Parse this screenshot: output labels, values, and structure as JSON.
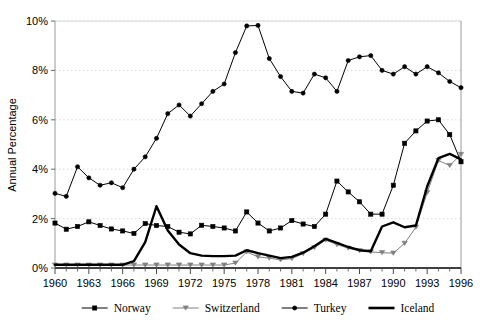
{
  "chart_data": {
    "type": "line",
    "title": "",
    "xlabel": "",
    "ylabel": "Annual Percentage",
    "xlim": [
      1960,
      1996
    ],
    "ylim": [
      0,
      10
    ],
    "grid": true,
    "grid_axis": "y",
    "legend_position": "bottom",
    "y_tick_labels": [
      "0%",
      "2%",
      "4%",
      "6%",
      "8%",
      "10%"
    ],
    "y_tick_values": [
      0,
      2,
      4,
      6,
      8,
      10
    ],
    "x_tick_labels": [
      "1960",
      "1963",
      "1966",
      "1969",
      "1972",
      "1975",
      "1978",
      "1981",
      "1984",
      "1987",
      "1990",
      "1993",
      "1996"
    ],
    "x_tick_values": [
      1960,
      1963,
      1966,
      1969,
      1972,
      1975,
      1978,
      1981,
      1984,
      1987,
      1990,
      1993,
      1996
    ],
    "x": [
      1960,
      1961,
      1962,
      1963,
      1964,
      1965,
      1966,
      1967,
      1968,
      1969,
      1970,
      1971,
      1972,
      1973,
      1974,
      1975,
      1976,
      1977,
      1978,
      1979,
      1980,
      1981,
      1982,
      1983,
      1984,
      1985,
      1986,
      1987,
      1988,
      1989,
      1990,
      1991,
      1992,
      1993,
      1994,
      1995,
      1996
    ],
    "series": [
      {
        "name": "Norway",
        "marker": "square",
        "color": "#000000",
        "marker_color": "#000000",
        "line_width": 1,
        "values": [
          1.82,
          1.57,
          1.68,
          1.87,
          1.72,
          1.58,
          1.5,
          1.4,
          1.8,
          1.72,
          1.68,
          1.45,
          1.38,
          1.73,
          1.68,
          1.62,
          1.5,
          2.27,
          1.82,
          1.5,
          1.62,
          1.92,
          1.78,
          1.68,
          2.18,
          3.52,
          3.08,
          2.68,
          2.18,
          2.18,
          3.35,
          5.05,
          5.55,
          5.95,
          6.0,
          5.4,
          4.3
        ]
      },
      {
        "name": "Switzerland",
        "marker": "triangle-down",
        "color": "#808080",
        "marker_color": "#808080",
        "line_width": 1,
        "values": [
          0.12,
          0.12,
          0.12,
          0.12,
          0.12,
          0.12,
          0.12,
          0.12,
          0.12,
          0.12,
          0.12,
          0.12,
          0.12,
          0.12,
          0.12,
          0.12,
          0.2,
          0.65,
          0.45,
          0.4,
          0.33,
          0.38,
          0.58,
          0.82,
          1.13,
          0.95,
          0.8,
          0.7,
          0.65,
          0.62,
          0.6,
          1.0,
          1.65,
          3.05,
          4.35,
          4.15,
          4.6
        ]
      },
      {
        "name": "Turkey",
        "marker": "circle",
        "color": "#000000",
        "marker_color": "#000000",
        "line_width": 1,
        "values": [
          3.02,
          2.9,
          4.1,
          3.65,
          3.35,
          3.45,
          3.25,
          4.0,
          4.5,
          5.25,
          6.25,
          6.6,
          6.15,
          6.65,
          7.15,
          7.45,
          8.72,
          9.8,
          9.82,
          8.48,
          7.75,
          7.15,
          7.08,
          7.85,
          7.7,
          7.15,
          8.4,
          8.55,
          8.6,
          8.0,
          7.85,
          8.15,
          7.85,
          8.15,
          7.9,
          7.55,
          7.3
        ]
      },
      {
        "name": "Iceland",
        "marker": "none",
        "color": "#000000",
        "marker_color": "#000000",
        "line_width": 2.4,
        "values": [
          0.13,
          0.13,
          0.13,
          0.13,
          0.13,
          0.13,
          0.13,
          0.28,
          1.05,
          2.5,
          1.52,
          0.95,
          0.6,
          0.5,
          0.48,
          0.48,
          0.5,
          0.72,
          0.6,
          0.5,
          0.4,
          0.45,
          0.62,
          0.88,
          1.18,
          1.02,
          0.85,
          0.72,
          0.68,
          1.68,
          1.85,
          1.65,
          1.72,
          3.3,
          4.45,
          4.62,
          4.4
        ]
      }
    ]
  },
  "legend": {
    "items": [
      {
        "label": "Norway",
        "marker": "square",
        "color": "#000000"
      },
      {
        "label": "Switzerland",
        "marker": "triangle-down",
        "color": "#808080"
      },
      {
        "label": "Turkey",
        "marker": "circle",
        "color": "#000000"
      },
      {
        "label": "Iceland",
        "marker": "none",
        "color": "#000000"
      }
    ]
  },
  "axes": {
    "y_title": "Annual Percentage"
  }
}
